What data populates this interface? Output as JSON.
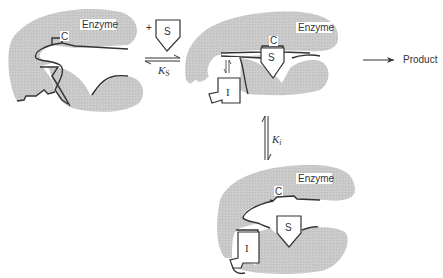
{
  "diagram": {
    "type": "enzyme-inhibition-mechanism",
    "colors": {
      "enzyme_fill": "#c9c9c9",
      "outline": "#333333",
      "background": "#ffffff"
    },
    "enzyme_free": {
      "label": "Enzyme",
      "site_label": "C"
    },
    "substrate_add": {
      "plus": "+",
      "label": "S"
    },
    "equilibrium_ks": {
      "constant": "K",
      "subscript": "S"
    },
    "enzyme_es": {
      "label": "Enzyme",
      "site_label": "C",
      "substrate_label": "S",
      "inhibitor_label": "I"
    },
    "product_arrow": {
      "label": "Product"
    },
    "equilibrium_ki": {
      "constant": "K",
      "subscript": "i"
    },
    "enzyme_esi": {
      "label": "Enzyme",
      "site_label": "C",
      "substrate_label": "S",
      "inhibitor_label": "I"
    }
  }
}
